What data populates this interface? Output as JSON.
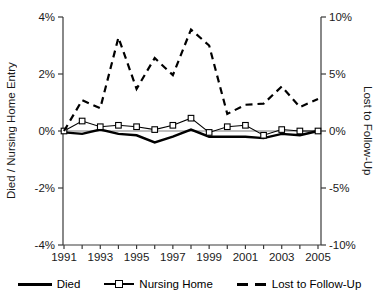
{
  "chart_data": {
    "type": "line",
    "x": [
      1991,
      1992,
      1993,
      1994,
      1995,
      1996,
      1997,
      1998,
      1999,
      2000,
      2001,
      2002,
      2003,
      2004,
      2005
    ],
    "series": [
      {
        "name": "Died",
        "axis": "left",
        "style": "thick-solid",
        "values": [
          -0.05,
          -0.1,
          0.05,
          -0.1,
          -0.15,
          -0.4,
          -0.2,
          0.05,
          -0.2,
          -0.2,
          -0.2,
          -0.25,
          -0.1,
          -0.15,
          0.0
        ]
      },
      {
        "name": "Nursing Home",
        "axis": "left",
        "style": "thin-solid-square-markers",
        "values": [
          0.0,
          0.35,
          0.15,
          0.2,
          0.15,
          0.05,
          0.2,
          0.45,
          -0.05,
          0.15,
          0.2,
          -0.15,
          0.05,
          0.0,
          0.0
        ]
      },
      {
        "name": "Lost to Follow-Up",
        "axis": "right",
        "style": "dashed",
        "values": [
          0.0,
          2.7,
          2.0,
          8.2,
          3.7,
          6.4,
          4.9,
          8.9,
          7.5,
          1.5,
          2.3,
          2.4,
          3.9,
          2.1,
          2.8
        ]
      }
    ],
    "left_axis": {
      "label": "Died / Nursing Home Entry",
      "ticks": [
        "4%",
        "2%",
        "0%",
        "-2%",
        "-4%"
      ],
      "range": [
        -4,
        4
      ]
    },
    "right_axis": {
      "label": "Lost to Follow-Up",
      "ticks": [
        "10%",
        "5%",
        "0%",
        "-5%",
        "-10%"
      ],
      "range": [
        -10,
        10
      ]
    },
    "x_axis": {
      "label_years": [
        1991,
        1993,
        1995,
        1997,
        1999,
        2001,
        2003,
        2005
      ]
    },
    "legend": [
      "Died",
      "Nursing Home",
      "Lost to Follow-Up"
    ],
    "grid": "zero-line-only",
    "legend_position": "bottom",
    "colors": {
      "series": "#000000",
      "zero_line": "#a8a8a8",
      "axis": "#3a3a3a",
      "marker_fill": "#ffffff"
    }
  }
}
